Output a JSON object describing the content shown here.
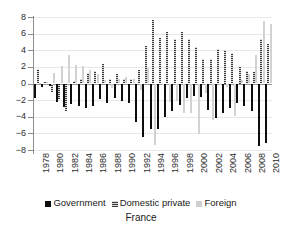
{
  "chart_data": {
    "type": "bar",
    "title": "France",
    "subtitle": "",
    "xlabel": "",
    "ylabel": "",
    "ylim": [
      -8,
      8
    ],
    "ytick_labels": [
      "8",
      "6",
      "4",
      "2",
      "0",
      "-2",
      "-4",
      "-6",
      "-8"
    ],
    "ytick_values": [
      8,
      6,
      4,
      2,
      0,
      -2,
      -4,
      -6,
      -8
    ],
    "grid": true,
    "legend_position": "bottom",
    "categories": [
      1978,
      1979,
      1980,
      1981,
      1982,
      1983,
      1984,
      1985,
      1986,
      1987,
      1988,
      1989,
      1990,
      1991,
      1992,
      1993,
      1994,
      1995,
      1996,
      1997,
      1998,
      1999,
      2000,
      2001,
      2002,
      2003,
      2004,
      2005,
      2006,
      2007,
      2008,
      2009,
      2010
    ],
    "xtick_labels": [
      "1978",
      "1980",
      "1982",
      "1984",
      "1986",
      "1988",
      "1990",
      "1992",
      "1994",
      "1996",
      "1998",
      "2000",
      "2002",
      "2004",
      "2006",
      "2008",
      "2010"
    ],
    "series": [
      {
        "name": "Government",
        "color": "#0d0d0d",
        "values": [
          -1.8,
          -0.4,
          -0.3,
          -2.2,
          -2.8,
          -2.5,
          -2.7,
          -2.9,
          -2.7,
          -1.9,
          -2.4,
          -1.7,
          -2.1,
          -2.4,
          -4.6,
          -6.4,
          -5.5,
          -5.5,
          -4.0,
          -3.3,
          -2.6,
          -1.8,
          -1.5,
          -1.6,
          -3.2,
          -4.1,
          -3.6,
          -3.0,
          -2.4,
          -2.7,
          -3.3,
          -7.5,
          -7.1
        ]
      },
      {
        "name": "Domestic private",
        "color": "#7c7c7c",
        "values": [
          1.7,
          0.2,
          -1.0,
          -1.9,
          -3.3,
          0.3,
          0.6,
          1.3,
          1.5,
          2.3,
          0.5,
          1.2,
          0.6,
          0.6,
          1.6,
          4.5,
          7.6,
          5.5,
          6.2,
          5.3,
          6.2,
          5.3,
          4.4,
          2.9,
          3.0,
          4.1,
          4.0,
          3.7,
          2.0,
          1.5,
          1.4,
          5.4,
          4.8
        ]
      },
      {
        "name": "Foreign",
        "color": "#d2d2d2",
        "values": [
          0.1,
          0.2,
          1.3,
          2.1,
          3.4,
          2.2,
          2.1,
          1.6,
          1.2,
          0.4,
          -0.5,
          0.5,
          0.8,
          0.5,
          -0.8,
          1.9,
          -7.4,
          0.0,
          -2.2,
          -2.1,
          -3.6,
          -3.5,
          -6.1,
          -1.2,
          -4.4,
          0.0,
          -0.4,
          -3.9,
          0.4,
          1.1,
          3.4,
          7.5,
          7.1
        ]
      }
    ]
  },
  "legend": {
    "items": [
      {
        "label": "Government"
      },
      {
        "label": "Domestic private"
      },
      {
        "label": "Foreign"
      }
    ]
  }
}
